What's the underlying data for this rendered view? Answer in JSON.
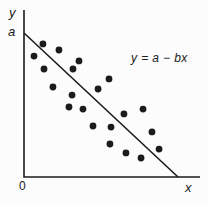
{
  "figure": {
    "background": "#fcfcfc",
    "ink_color": "#1b1b1b",
    "equation_label": "y = a − bx",
    "y_axis_label": "y",
    "x_axis_label": "x",
    "y_intercept_label": "a",
    "origin_label": "0"
  },
  "chart_data": {
    "type": "scatter",
    "title": "",
    "xlabel": "x",
    "ylabel": "y",
    "grid": false,
    "x_ticks": [
      {
        "label": "0",
        "value": 0
      }
    ],
    "y_ticks": [
      {
        "label": "a",
        "value": 1.0
      }
    ],
    "x_range": [
      0,
      1.14
    ],
    "y_range": [
      0,
      1.16
    ],
    "annotations": [
      {
        "text": "y = a − bx",
        "position": "upper-right"
      }
    ],
    "points_units": "fractions of intercepts: y-intercept a = 1.0 on y, x-intercept of line = 1.0 on x",
    "points": [
      [
        0.123,
        0.924
      ],
      [
        0.227,
        0.882
      ],
      [
        0.065,
        0.84
      ],
      [
        0.357,
        0.806
      ],
      [
        0.13,
        0.75
      ],
      [
        0.318,
        0.75
      ],
      [
        0.552,
        0.681
      ],
      [
        0.188,
        0.625
      ],
      [
        0.481,
        0.611
      ],
      [
        0.312,
        0.569
      ],
      [
        0.292,
        0.486
      ],
      [
        0.383,
        0.472
      ],
      [
        0.773,
        0.472
      ],
      [
        0.649,
        0.438
      ],
      [
        0.448,
        0.354
      ],
      [
        0.565,
        0.347
      ],
      [
        0.831,
        0.313
      ],
      [
        0.558,
        0.229
      ],
      [
        0.877,
        0.194
      ],
      [
        0.662,
        0.167
      ],
      [
        0.76,
        0.132
      ]
    ],
    "trend_line": {
      "equation": "y = a - bx",
      "x1": 0,
      "y1": 1.0,
      "x2": 1.0,
      "y2": 0
    },
    "layout": {
      "origin_px": [
        24,
        177
      ],
      "y_axis_top_px": 10,
      "x_axis_end_px": 200,
      "x_scale_px": 154,
      "y_scale_px": 144,
      "dot_radius_px": 3.4,
      "stroke_px": 1.6
    }
  }
}
